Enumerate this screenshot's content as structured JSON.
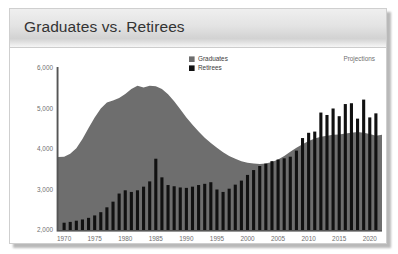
{
  "window": {
    "title": "Graduates vs. Retirees"
  },
  "chart_data": {
    "type": "area",
    "title": "Graduates vs. Retirees",
    "xlabel": "",
    "ylabel": "",
    "xlim": [
      1969,
      2022
    ],
    "ylim": [
      2000,
      6000
    ],
    "ytick_values": [
      2000,
      3000,
      4000,
      5000,
      6000
    ],
    "ytick_labels": [
      "2,000",
      "3,000",
      "4,000",
      "5,000",
      "6,000"
    ],
    "xtick_values": [
      1970,
      1975,
      1980,
      1985,
      1990,
      1995,
      2000,
      2005,
      2010,
      2015,
      2020
    ],
    "xtick_labels": [
      "1970",
      "1975",
      "1980",
      "1985",
      "1990",
      "1995",
      "2000",
      "2005",
      "2010",
      "2015",
      "2020"
    ],
    "grid": false,
    "legend_position": "top-center",
    "annotations": [
      {
        "text": "Projections",
        "x": 2017,
        "y": 5900
      }
    ],
    "colors": {
      "graduates": "#6e6e6e",
      "retirees": "#111111",
      "axis": "#555555",
      "tick_text": "#6f6f6f"
    },
    "series": [
      {
        "name": "Graduates",
        "type": "area",
        "color": "#6e6e6e",
        "x": [
          1969,
          1970,
          1971,
          1972,
          1973,
          1974,
          1975,
          1976,
          1977,
          1978,
          1979,
          1980,
          1981,
          1982,
          1983,
          1984,
          1985,
          1986,
          1987,
          1988,
          1989,
          1990,
          1991,
          1992,
          1993,
          1994,
          1995,
          1996,
          1997,
          1998,
          1999,
          2000,
          2001,
          2002,
          2003,
          2004,
          2005,
          2006,
          2007,
          2008,
          2009,
          2010,
          2011,
          2012,
          2013,
          2014,
          2015,
          2016,
          2017,
          2018,
          2019,
          2020,
          2021,
          2022
        ],
        "values": [
          3800,
          3810,
          3880,
          4020,
          4250,
          4520,
          4780,
          5000,
          5150,
          5200,
          5260,
          5360,
          5480,
          5560,
          5520,
          5560,
          5550,
          5480,
          5350,
          5180,
          4980,
          4780,
          4600,
          4430,
          4280,
          4150,
          4030,
          3920,
          3830,
          3760,
          3700,
          3660,
          3640,
          3630,
          3640,
          3680,
          3740,
          3830,
          3930,
          4030,
          4120,
          4200,
          4260,
          4300,
          4330,
          4350,
          4360,
          4380,
          4400,
          4420,
          4400,
          4370,
          4330,
          4350
        ]
      },
      {
        "name": "Retirees",
        "type": "bar",
        "color": "#111111",
        "x": [
          1970,
          1971,
          1972,
          1973,
          1974,
          1975,
          1976,
          1977,
          1978,
          1979,
          1980,
          1981,
          1982,
          1983,
          1984,
          1985,
          1986,
          1987,
          1988,
          1989,
          1990,
          1991,
          1992,
          1993,
          1994,
          1995,
          1996,
          1997,
          1998,
          1999,
          2000,
          2001,
          2002,
          2003,
          2004,
          2005,
          2006,
          2007,
          2008,
          2009,
          2010,
          2011,
          2012,
          2013,
          2014,
          2015,
          2016,
          2017,
          2018,
          2019,
          2020,
          2021
        ],
        "values": [
          2180,
          2200,
          2230,
          2260,
          2300,
          2360,
          2440,
          2560,
          2700,
          2900,
          2980,
          2940,
          2980,
          3070,
          3200,
          3760,
          3300,
          3110,
          3080,
          3050,
          3040,
          3070,
          3110,
          3140,
          3180,
          3000,
          2940,
          3020,
          3120,
          3220,
          3360,
          3480,
          3580,
          3640,
          3700,
          3740,
          3770,
          3810,
          3960,
          4270,
          4400,
          4430,
          4900,
          4840,
          5000,
          4810,
          5110,
          5130,
          4750,
          5220,
          4780,
          4880
        ]
      }
    ]
  },
  "legend": {
    "items": [
      {
        "label": "Graduates",
        "color": "#6e6e6e"
      },
      {
        "label": "Retirees",
        "color": "#111111"
      }
    ]
  },
  "annotation": {
    "projections_label": "Projections"
  }
}
